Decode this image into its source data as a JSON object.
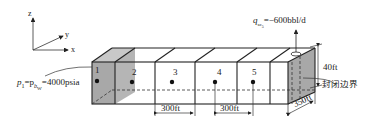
{
  "axes": {
    "z": "z",
    "y": "y",
    "x": "x"
  },
  "blocks": [
    {
      "id": "1",
      "label": "1"
    },
    {
      "id": "2",
      "label": "2"
    },
    {
      "id": "3",
      "label": "3"
    },
    {
      "id": "4",
      "label": "4"
    },
    {
      "id": "5",
      "label": "5"
    }
  ],
  "annotations": {
    "pressure_left": "p₁=p_b₁=4000psia",
    "pressure_prefix": "p",
    "pressure_sub1": "1",
    "pressure_mid": "=p",
    "pressure_sub2": "b",
    "pressure_sub2b": "W",
    "pressure_value": "=4000psia",
    "rate_prefix": "q",
    "rate_sub": "sc",
    "rate_sub2": "5",
    "rate_value": "=−600bbl/d",
    "height": "40ft",
    "boundary": "封闭边界",
    "dx1": "300ft",
    "dx2": "300ft",
    "width": "350ft"
  },
  "colors": {
    "shade": "#a8a8a8",
    "line": "#222222"
  }
}
